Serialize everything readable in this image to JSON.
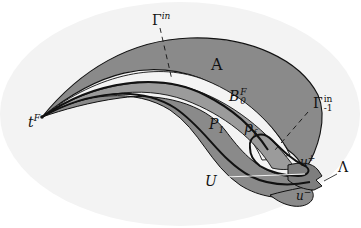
{
  "diagram": {
    "colors": {
      "background": "#ffffff",
      "backdrop": "#f1f1f1",
      "band_fill": "#8a8a8a",
      "inner_band_fill": "#9b9b9b",
      "light_region": "#f4f4f4",
      "stroke": "#111111"
    },
    "labels": {
      "gamma_in": {
        "base": "Γ",
        "sup": "in"
      },
      "A": {
        "text": "A"
      },
      "B0F": {
        "base": "B",
        "sup": "F",
        "sub": "0"
      },
      "gamma_minus1_in": {
        "base": "Γ",
        "sup": "in",
        "sub": "-1"
      },
      "tF": {
        "base": "t",
        "sup": "F"
      },
      "P1": {
        "base": "P",
        "sub": "1"
      },
      "pf": {
        "base": "p",
        "sub": "f"
      },
      "u_plus": {
        "base": "u",
        "sup": "+"
      },
      "Lambda": {
        "text": "Λ"
      },
      "U": {
        "text": "U"
      },
      "u_minus": {
        "base": "u",
        "sup": "−"
      }
    }
  }
}
